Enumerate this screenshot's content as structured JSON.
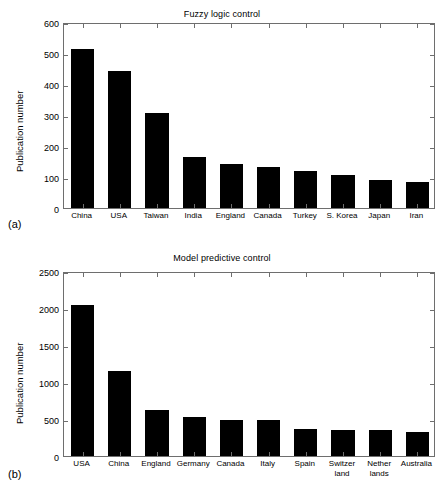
{
  "figure": {
    "background": "#ffffff",
    "bar_color": "#000000",
    "axis_color": "#6e6e6e"
  },
  "panels": [
    {
      "tag": "(a)",
      "title": "Fuzzy logic control",
      "ylabel": "Publication number",
      "yticks": [
        "0",
        "100",
        "200",
        "300",
        "400",
        "500",
        "600"
      ]
    },
    {
      "tag": "(b)",
      "title": "Model predictive control",
      "ylabel": "Publication number",
      "yticks": [
        "0",
        "500",
        "1000",
        "1500",
        "2000",
        "2500"
      ]
    }
  ],
  "chart_data": [
    {
      "type": "bar",
      "title": "Fuzzy logic control",
      "panel": "(a)",
      "xlabel": "",
      "ylabel": "Publication number",
      "ylim": [
        0,
        600
      ],
      "ytick_step": 100,
      "grid": false,
      "legend": "none",
      "categories": [
        "China",
        "USA",
        "Taiwan",
        "India",
        "England",
        "Canada",
        "Turkey",
        "S. Korea",
        "Japan",
        "Iran"
      ],
      "values": [
        512,
        443,
        305,
        163,
        142,
        133,
        121,
        108,
        91,
        83
      ]
    },
    {
      "type": "bar",
      "title": "Model predictive control",
      "panel": "(b)",
      "xlabel": "",
      "ylabel": "Publication number",
      "ylim": [
        0,
        2500
      ],
      "ytick_step": 500,
      "grid": false,
      "legend": "none",
      "categories": [
        "USA",
        "China",
        "England",
        "Germany",
        "Canada",
        "Italy",
        "Spain",
        "Switzer land",
        "Nether lands",
        "Australia"
      ],
      "category_lines": [
        [
          "USA"
        ],
        [
          "China"
        ],
        [
          "England"
        ],
        [
          "Germany"
        ],
        [
          "Canada"
        ],
        [
          "Italy"
        ],
        [
          "Spain"
        ],
        [
          "Switzer",
          "land"
        ],
        [
          "Nether",
          "lands"
        ],
        [
          "Australia"
        ]
      ],
      "values": [
        2042,
        1155,
        623,
        521,
        489,
        481,
        369,
        350,
        345,
        330
      ]
    }
  ]
}
